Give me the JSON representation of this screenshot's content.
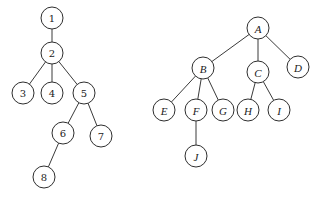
{
  "trees": [
    {
      "name": "numeric-tree",
      "label_style": "upright",
      "nodes": [
        {
          "id": "1",
          "label": "1",
          "x": 52,
          "y": 18
        },
        {
          "id": "2",
          "label": "2",
          "x": 52,
          "y": 53
        },
        {
          "id": "3",
          "label": "3",
          "x": 23,
          "y": 93
        },
        {
          "id": "4",
          "label": "4",
          "x": 52,
          "y": 93
        },
        {
          "id": "5",
          "label": "5",
          "x": 84,
          "y": 93
        },
        {
          "id": "6",
          "label": "6",
          "x": 63,
          "y": 133
        },
        {
          "id": "7",
          "label": "7",
          "x": 101,
          "y": 136
        },
        {
          "id": "8",
          "label": "8",
          "x": 44,
          "y": 177
        }
      ],
      "edges": [
        [
          "1",
          "2"
        ],
        [
          "2",
          "3"
        ],
        [
          "2",
          "4"
        ],
        [
          "2",
          "5"
        ],
        [
          "5",
          "6"
        ],
        [
          "5",
          "7"
        ],
        [
          "6",
          "8"
        ]
      ]
    },
    {
      "name": "letter-tree",
      "label_style": "italic",
      "nodes": [
        {
          "id": "A",
          "label": "A",
          "x": 258,
          "y": 28
        },
        {
          "id": "B",
          "label": "B",
          "x": 203,
          "y": 68
        },
        {
          "id": "C",
          "label": "C",
          "x": 258,
          "y": 72
        },
        {
          "id": "D",
          "label": "D",
          "x": 298,
          "y": 67
        },
        {
          "id": "E",
          "label": "E",
          "x": 164,
          "y": 110
        },
        {
          "id": "F",
          "label": "F",
          "x": 196,
          "y": 110
        },
        {
          "id": "G",
          "label": "G",
          "x": 223,
          "y": 110
        },
        {
          "id": "H",
          "label": "H",
          "x": 248,
          "y": 110
        },
        {
          "id": "I",
          "label": "I",
          "x": 279,
          "y": 110
        },
        {
          "id": "J",
          "label": "J",
          "x": 196,
          "y": 156
        }
      ],
      "edges": [
        [
          "A",
          "B"
        ],
        [
          "A",
          "C"
        ],
        [
          "A",
          "D"
        ],
        [
          "B",
          "E"
        ],
        [
          "B",
          "F"
        ],
        [
          "B",
          "G"
        ],
        [
          "C",
          "H"
        ],
        [
          "C",
          "I"
        ],
        [
          "F",
          "J"
        ]
      ]
    }
  ],
  "node_radius": 11
}
